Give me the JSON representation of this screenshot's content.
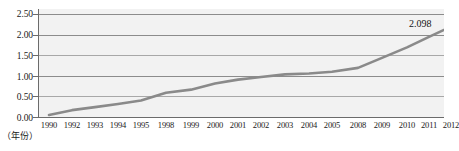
{
  "chart_data": {
    "type": "line",
    "title": "",
    "xlabel": "（年份）",
    "ylabel": "",
    "ylim": [
      0.0,
      2.5
    ],
    "ytick_labels": [
      "0.00",
      "0.50",
      "1.00",
      "1.50",
      "2.00",
      "2.50"
    ],
    "ytick_values": [
      0.0,
      0.5,
      1.0,
      1.5,
      2.0,
      2.5
    ],
    "grid": true,
    "legend": "none",
    "categories": [
      "1990",
      "1992",
      "1993",
      "1994",
      "1995",
      "1998",
      "1999",
      "2000",
      "2001",
      "2002",
      "2003",
      "2004",
      "2005",
      "2008",
      "2009",
      "2010",
      "2011",
      "2012"
    ],
    "values": [
      0.07,
      0.18,
      0.25,
      0.32,
      0.4,
      0.58,
      0.65,
      0.79,
      0.88,
      0.94,
      1.0,
      1.02,
      1.06,
      1.15,
      1.38,
      1.62,
      1.86,
      2.098
    ],
    "annotations": [
      {
        "name": "last-point-value",
        "text": "2.098",
        "category": "2012",
        "value": 2.098
      }
    ],
    "series_color": "#8a8a8a",
    "plot_background": "#f2f2f2",
    "gridline_color": "#8c8c8c"
  }
}
